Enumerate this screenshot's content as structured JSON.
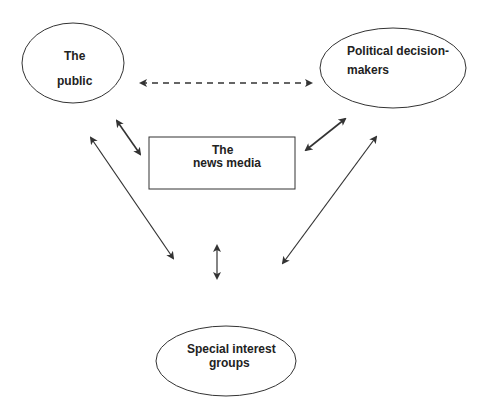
{
  "diagram": {
    "nodes": {
      "public": {
        "line1": "The",
        "line2": "public"
      },
      "political": {
        "line1": "Political decision-",
        "line2": "makers"
      },
      "media": {
        "line1": "The",
        "line2": "news media"
      },
      "interest": {
        "line1": "Special interest",
        "line2": "groups"
      }
    },
    "edges": [
      {
        "from": "public",
        "to": "political",
        "style": "dashed",
        "direction": "both"
      },
      {
        "from": "public",
        "to": "media",
        "style": "solid",
        "direction": "both"
      },
      {
        "from": "political",
        "to": "media",
        "style": "solid",
        "direction": "both"
      },
      {
        "from": "public",
        "to": "interest",
        "style": "solid",
        "direction": "both"
      },
      {
        "from": "political",
        "to": "interest",
        "style": "solid",
        "direction": "both"
      },
      {
        "from": "media",
        "to": "interest",
        "style": "solid",
        "direction": "both"
      }
    ],
    "colors": {
      "stroke": "#333333",
      "background": "#ffffff"
    }
  }
}
